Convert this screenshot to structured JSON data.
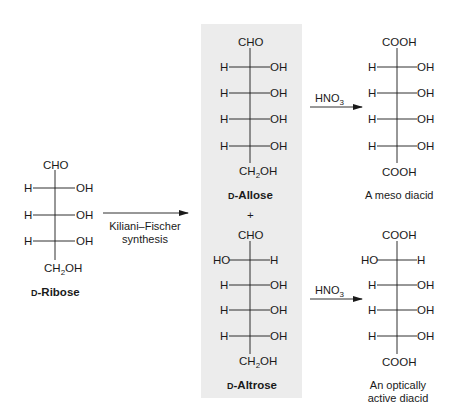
{
  "figure": {
    "type": "reaction-scheme",
    "starting_material": {
      "name_prefix": "D",
      "name": "-Ribose",
      "top": "CHO",
      "rows": [
        {
          "left": "H",
          "right": "OH"
        },
        {
          "left": "H",
          "right": "OH"
        },
        {
          "left": "H",
          "right": "OH"
        }
      ],
      "bottom": "CH2OH"
    },
    "step1": {
      "reagent_line1": "Kiliani–Fischer",
      "reagent_line2": "synthesis"
    },
    "intermediates": {
      "plus": "+",
      "allose": {
        "name_prefix": "D",
        "name": "-Allose",
        "top": "CHO",
        "rows": [
          {
            "left": "H",
            "right": "OH"
          },
          {
            "left": "H",
            "right": "OH"
          },
          {
            "left": "H",
            "right": "OH"
          },
          {
            "left": "H",
            "right": "OH"
          }
        ],
        "bottom": "CH2OH"
      },
      "altrose": {
        "name_prefix": "D",
        "name": "-Altrose",
        "top": "CHO",
        "rows": [
          {
            "left": "HO",
            "right": "H"
          },
          {
            "left": "H",
            "right": "OH"
          },
          {
            "left": "H",
            "right": "OH"
          },
          {
            "left": "H",
            "right": "OH"
          }
        ],
        "bottom": "CH2OH"
      }
    },
    "step2": {
      "reagent": "HNO3",
      "reagent_main": "HNO",
      "reagent_sub": "3"
    },
    "products": {
      "meso": {
        "top": "COOH",
        "rows": [
          {
            "left": "H",
            "right": "OH"
          },
          {
            "left": "H",
            "right": "OH"
          },
          {
            "left": "H",
            "right": "OH"
          },
          {
            "left": "H",
            "right": "OH"
          }
        ],
        "bottom": "COOH",
        "caption": "A meso diacid"
      },
      "active": {
        "top": "COOH",
        "rows": [
          {
            "left": "HO",
            "right": "H"
          },
          {
            "left": "H",
            "right": "OH"
          },
          {
            "left": "H",
            "right": "OH"
          },
          {
            "left": "H",
            "right": "OH"
          }
        ],
        "bottom": "COOH",
        "caption_line1": "An optically",
        "caption_line2": "active diacid"
      }
    },
    "colors": {
      "ink": "#1a1a1a",
      "highlight_box": "#ececec",
      "background": "#ffffff"
    }
  }
}
